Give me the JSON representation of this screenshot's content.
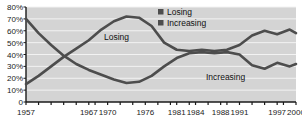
{
  "chart_data": {
    "type": "line",
    "title": "",
    "subtitle": "",
    "xlabel": "",
    "ylabel": "",
    "grid": true,
    "legend_position": "top-right",
    "plot_background": "#d4d4d4",
    "gridline_color": "#f2f2f2",
    "axis_color": "#1a1a1a",
    "xlim": [
      1957,
      2000
    ],
    "ylim": [
      0,
      80
    ],
    "y_ticks": [
      0,
      10,
      20,
      30,
      40,
      50,
      60,
      70,
      80
    ],
    "y_tick_labels": [
      "0",
      "10%",
      "20%",
      "30%",
      "40%",
      "50%",
      "60%",
      "70%",
      "80%"
    ],
    "x_tick_labels": [
      "1957",
      "1967",
      "1970",
      "1976",
      "1981",
      "1984",
      "1988",
      "1991",
      "1997",
      "2000"
    ],
    "x_tick_values": [
      1957,
      1967,
      1970,
      1976,
      1981,
      1984,
      1988,
      1991,
      1997,
      2000
    ],
    "x_minor_ticks": [
      1957,
      1959,
      1961,
      1963,
      1965,
      1967,
      1968,
      1970,
      1972,
      1974,
      1976,
      1978,
      1980,
      1981,
      1983,
      1984,
      1986,
      1988,
      1989,
      1991,
      1993,
      1995,
      1997,
      1998,
      2000
    ],
    "series": [
      {
        "name": "Losing",
        "color": "#4d4d4d",
        "marker": "square",
        "x": [
          1957,
          1959,
          1961,
          1963,
          1965,
          1967,
          1969,
          1971,
          1973,
          1975,
          1977,
          1979,
          1981,
          1983,
          1985,
          1987,
          1989,
          1991,
          1993,
          1995,
          1997,
          1999,
          2000
        ],
        "values": [
          15,
          22,
          30,
          38,
          45,
          52,
          61,
          68,
          72,
          71,
          64,
          50,
          44,
          43,
          44,
          43,
          44,
          48,
          56,
          60,
          57,
          61,
          58
        ]
      },
      {
        "name": "Increasing",
        "color": "#4d4d4d",
        "marker": "square",
        "x": [
          1957,
          1959,
          1961,
          1963,
          1965,
          1967,
          1969,
          1971,
          1973,
          1975,
          1977,
          1979,
          1981,
          1983,
          1985,
          1987,
          1989,
          1991,
          1993,
          1995,
          1997,
          1999,
          2000
        ],
        "values": [
          70,
          58,
          48,
          39,
          32,
          27,
          23,
          19,
          16,
          17,
          22,
          30,
          37,
          41,
          42,
          41,
          42,
          40,
          31,
          28,
          33,
          30,
          32
        ]
      }
    ]
  },
  "legend": {
    "items": [
      {
        "label": "Losing",
        "color": "#4d4d4d"
      },
      {
        "label": "Increasing",
        "color": "#4d4d4d"
      }
    ]
  },
  "annotations": [
    {
      "name": "losing-inline-label",
      "text": "Losing",
      "x": 104,
      "y": 40
    },
    {
      "name": "increasing-inline-label",
      "text": "Increasing",
      "x": 206,
      "y": 80
    }
  ]
}
